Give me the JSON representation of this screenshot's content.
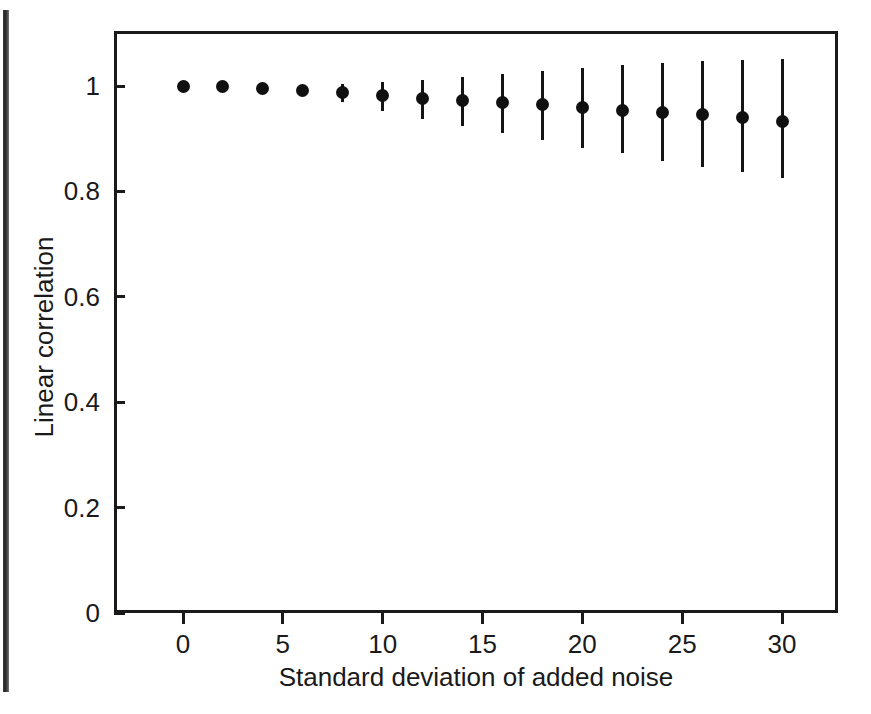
{
  "chart_data": {
    "type": "scatter",
    "title": "",
    "xlabel": "Standard deviation of added noise",
    "ylabel": "Linear correlation",
    "xlim": [
      -1.25,
      35.0
    ],
    "ylim": [
      0,
      1.104
    ],
    "xticks": [
      0,
      5,
      10,
      15,
      20,
      25,
      30
    ],
    "xticklabels": [
      "0",
      "5",
      "10",
      "15",
      "20",
      "25",
      "30"
    ],
    "yticks": [
      0,
      0.2,
      0.4,
      0.6,
      0.8,
      1
    ],
    "yticklabels": [
      "0",
      "0.2",
      "0.4",
      "0.6",
      "0.8",
      "1"
    ],
    "grid": false,
    "legend": null,
    "marker": "filled-circle",
    "errorbars": true,
    "x": [
      0,
      2,
      4,
      6,
      8,
      10,
      12,
      14,
      16,
      18,
      20,
      22,
      24,
      26,
      28,
      30
    ],
    "values": [
      1.0,
      0.999,
      0.996,
      0.991,
      0.987,
      0.982,
      0.977,
      0.973,
      0.969,
      0.965,
      0.959,
      0.953,
      0.949,
      0.945,
      0.94,
      0.933
    ],
    "err_low": [
      1.0,
      0.998,
      0.99,
      0.981,
      0.969,
      0.953,
      0.938,
      0.925,
      0.911,
      0.897,
      0.883,
      0.872,
      0.858,
      0.846,
      0.836,
      0.825
    ],
    "err_high": [
      1.0,
      1.0,
      1.002,
      1.001,
      1.003,
      1.007,
      1.012,
      1.018,
      1.022,
      1.029,
      1.034,
      1.039,
      1.043,
      1.047,
      1.049,
      1.051
    ],
    "series": [
      {
        "name": "Linear correlation vs added noise",
        "values": [
          1.0,
          0.999,
          0.996,
          0.991,
          0.987,
          0.982,
          0.977,
          0.973,
          0.969,
          0.965,
          0.959,
          0.953,
          0.949,
          0.945,
          0.94,
          0.933
        ]
      }
    ]
  },
  "colors": {
    "ink": "#1a1a1a",
    "marker": "#101010",
    "background": "#ffffff"
  }
}
